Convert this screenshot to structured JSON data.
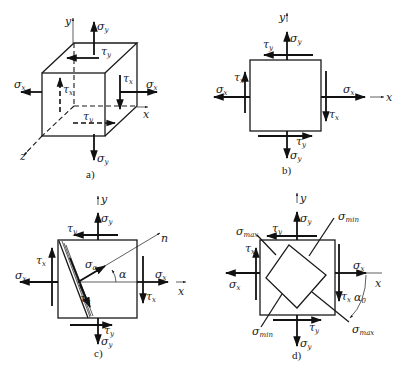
{
  "figure": {
    "panels": [
      {
        "id": "a",
        "caption": "a)",
        "kind": "3d-element",
        "axes": {
          "x": "x",
          "y": "y",
          "z": "z"
        },
        "stresses": {
          "sigma_y_top": {
            "sym": "σ",
            "sub": "y"
          },
          "tau_y_top": {
            "sym": "τ",
            "sub": "y"
          },
          "sigma_x_left": {
            "sym": "σ",
            "sub": "x"
          },
          "tau_x_left": {
            "sym": "τ",
            "sub": "x"
          },
          "tau_x_right": {
            "sym": "τ",
            "sub": "x"
          },
          "sigma_x_right": {
            "sym": "σ",
            "sub": "x"
          },
          "tau_y_bottom": {
            "sym": "τ",
            "sub": "y"
          },
          "sigma_y_bottom": {
            "sym": "σ",
            "sub": "y"
          }
        }
      },
      {
        "id": "b",
        "caption": "b)",
        "kind": "plane-element",
        "axes": {
          "x": "x",
          "y": "y"
        },
        "stresses": {
          "sigma_y_top": {
            "sym": "σ",
            "sub": "y"
          },
          "tau_y_top": {
            "sym": "τ",
            "sub": "y"
          },
          "sigma_x_left": {
            "sym": "σ",
            "sub": "x"
          },
          "tau_x_left": {
            "sym": "τ",
            "sub": "x"
          },
          "sigma_x_right": {
            "sym": "σ",
            "sub": "x"
          },
          "tau_x_right": {
            "sym": "τ",
            "sub": "x"
          },
          "tau_y_bottom": {
            "sym": "τ",
            "sub": "y"
          },
          "sigma_y_bottom": {
            "sym": "σ",
            "sub": "y"
          }
        }
      },
      {
        "id": "c",
        "caption": "c)",
        "kind": "inclined-section",
        "axes": {
          "x": "x",
          "y": "y",
          "n": "n"
        },
        "angle": "α",
        "stresses": {
          "sigma_y_top": {
            "sym": "σ",
            "sub": "y"
          },
          "tau_y_top": {
            "sym": "τ",
            "sub": "y"
          },
          "sigma_x_left": {
            "sym": "σ",
            "sub": "x"
          },
          "tau_x_left": {
            "sym": "τ",
            "sub": "x"
          },
          "sigma_x_right": {
            "sym": "σ",
            "sub": "x"
          },
          "tau_x_right": {
            "sym": "τ",
            "sub": "x"
          },
          "tau_y_bottom": {
            "sym": "τ",
            "sub": "y"
          },
          "sigma_y_bottom": {
            "sym": "σ",
            "sub": "y"
          },
          "sigma_alpha": {
            "sym": "σ",
            "sub": "α"
          },
          "tau_alpha": {
            "sym": "τ",
            "sub": "α"
          }
        }
      },
      {
        "id": "d",
        "caption": "d)",
        "kind": "principal-stresses",
        "axes": {
          "x": "x",
          "y": "y"
        },
        "angle": {
          "sym": "α",
          "sub": "0"
        },
        "stresses": {
          "sigma_y_top": {
            "sym": "σ",
            "sub": "y"
          },
          "tau_y_top": {
            "sym": "τ",
            "sub": "y"
          },
          "sigma_x_left": {
            "sym": "σ",
            "sub": "x"
          },
          "tau_x_left": {
            "sym": "τ",
            "sub": "x"
          },
          "sigma_x_right": {
            "sym": "σ",
            "sub": "x"
          },
          "tau_x_right": {
            "sym": "τ",
            "sub": "x"
          },
          "tau_y_bottom": {
            "sym": "τ",
            "sub": "y"
          },
          "sigma_y_bottom": {
            "sym": "σ",
            "sub": "y"
          },
          "sigma_max_upper": {
            "sym": "σ",
            "sub": "max"
          },
          "sigma_max_lower": {
            "sym": "σ",
            "sub": "max"
          },
          "sigma_min_upper": {
            "sym": "σ",
            "sub": "min"
          },
          "sigma_min_lower": {
            "sym": "σ",
            "sub": "min"
          }
        }
      }
    ]
  }
}
